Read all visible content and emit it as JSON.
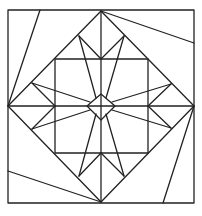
{
  "diagram": {
    "stroke_color": "#222222",
    "background": "#ffffff",
    "stroke_width": 1.3,
    "outer_square": {
      "x": 8,
      "y": 10,
      "w": 186,
      "h": 193
    },
    "big_diamond": [
      [
        101,
        11
      ],
      [
        194,
        106
      ],
      [
        101,
        202
      ],
      [
        8,
        106
      ]
    ],
    "inner_square": {
      "x": 55,
      "y": 59,
      "w": 93,
      "h": 94
    },
    "center_diamond": [
      [
        101,
        94
      ],
      [
        115,
        106
      ],
      [
        101,
        120
      ],
      [
        87,
        106
      ]
    ],
    "cross_lines": [
      [
        101,
        11,
        101,
        202
      ],
      [
        8,
        106,
        194,
        106
      ]
    ],
    "pinwheel_lines": [
      [
        8,
        106,
        40,
        10
      ],
      [
        101,
        11,
        194,
        43
      ],
      [
        194,
        106,
        163,
        203
      ],
      [
        101,
        202,
        8,
        171
      ]
    ],
    "star_short_lines": [
      [
        79,
        36,
        101,
        59
      ],
      [
        124,
        36,
        101,
        59
      ],
      [
        32,
        83,
        55,
        106
      ],
      [
        32,
        129,
        55,
        106
      ],
      [
        171,
        84,
        148,
        106
      ],
      [
        171,
        128,
        148,
        106
      ],
      [
        79,
        176,
        101,
        153
      ],
      [
        124,
        176,
        101,
        153
      ]
    ],
    "star_long_lines": [
      [
        79,
        36,
        96,
        98
      ],
      [
        124,
        36,
        106,
        98
      ],
      [
        32,
        83,
        90,
        102
      ],
      [
        32,
        129,
        90,
        110
      ],
      [
        171,
        84,
        112,
        102
      ],
      [
        171,
        128,
        112,
        110
      ],
      [
        79,
        176,
        96,
        114
      ],
      [
        124,
        176,
        106,
        114
      ]
    ]
  }
}
